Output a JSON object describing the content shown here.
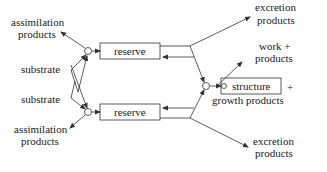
{
  "diagram": {
    "type": "flow diagram",
    "labels": {
      "assim_top_1": "assimilation",
      "assim_top_2": "products",
      "substrate_1": "substrate",
      "substrate_2": "substrate",
      "assim_bot_1": "assimilation",
      "assim_bot_2": "products",
      "reserve_top": "reserve",
      "reserve_bot": "reserve",
      "excretion_top_1": "excretion",
      "excretion_top_2": "products",
      "work_1": "work +",
      "work_2": "products",
      "structure": "structure",
      "plus": "+",
      "growth": "growth products",
      "excretion_bot_1": "excretion",
      "excretion_bot_2": "products"
    },
    "colors": {
      "line": "#333333",
      "text": "#222222",
      "background": "#ffffff"
    }
  }
}
